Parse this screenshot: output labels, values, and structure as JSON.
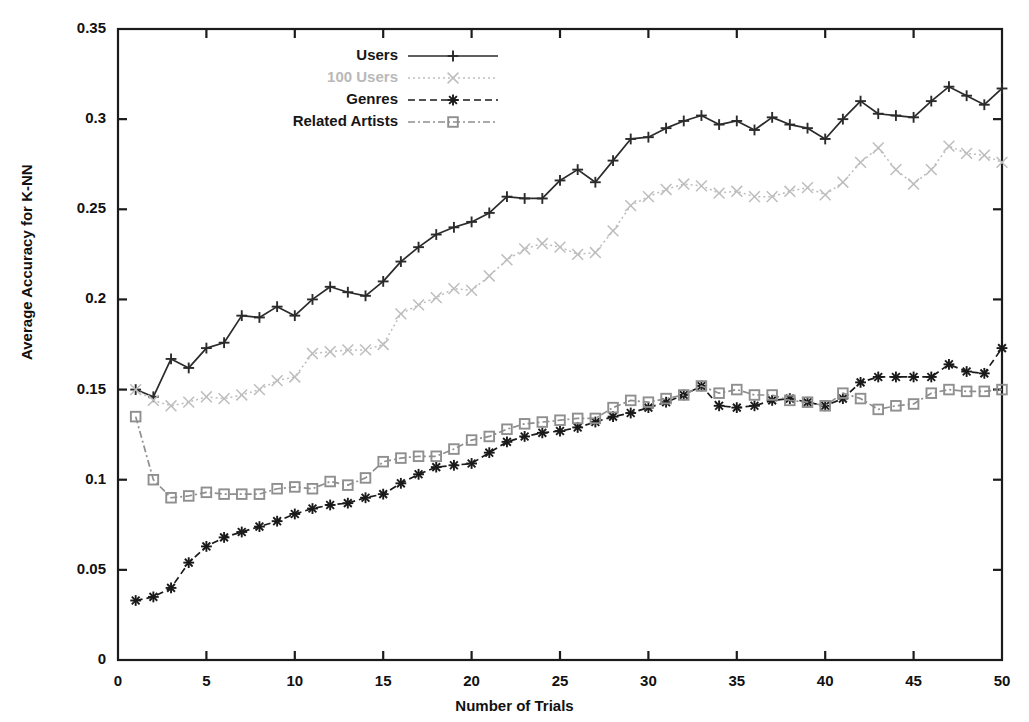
{
  "chart_data": {
    "type": "line",
    "title": "",
    "xlabel": "Number of Trials",
    "ylabel": "Average Accuracy for K-NN",
    "xlim": [
      0,
      50
    ],
    "ylim": [
      0,
      0.35
    ],
    "grid": false,
    "legend_position": "top-center",
    "xticks": [
      "0",
      "5",
      "10",
      "15",
      "20",
      "25",
      "30",
      "35",
      "40",
      "45",
      "50"
    ],
    "xtick_values": [
      0,
      5,
      10,
      15,
      20,
      25,
      30,
      35,
      40,
      45,
      50
    ],
    "yticks": [
      "0",
      "0.05",
      "0.1",
      "0.15",
      "0.2",
      "0.25",
      "0.3",
      "0.35"
    ],
    "ytick_values": [
      0,
      0.05,
      0.1,
      0.15,
      0.2,
      0.25,
      0.3,
      0.35
    ],
    "x": [
      1,
      2,
      3,
      4,
      5,
      6,
      7,
      8,
      9,
      10,
      11,
      12,
      13,
      14,
      15,
      16,
      17,
      18,
      19,
      20,
      21,
      22,
      23,
      24,
      25,
      26,
      27,
      28,
      29,
      30,
      31,
      32,
      33,
      34,
      35,
      36,
      37,
      38,
      39,
      40,
      41,
      42,
      43,
      44,
      45,
      46,
      47,
      48,
      49,
      50
    ],
    "series": [
      {
        "name": "Users",
        "marker": "plus",
        "line_style": "solid",
        "color": "#2b2b2b",
        "values": [
          0.15,
          0.146,
          0.167,
          0.162,
          0.173,
          0.176,
          0.191,
          0.19,
          0.196,
          0.191,
          0.2,
          0.207,
          0.204,
          0.202,
          0.21,
          0.221,
          0.229,
          0.236,
          0.24,
          0.243,
          0.248,
          0.257,
          0.256,
          0.256,
          0.266,
          0.272,
          0.265,
          0.277,
          0.289,
          0.29,
          0.295,
          0.299,
          0.302,
          0.297,
          0.299,
          0.294,
          0.301,
          0.297,
          0.295,
          0.289,
          0.3,
          0.31,
          0.303,
          0.302,
          0.301,
          0.31,
          0.318,
          0.313,
          0.308,
          0.317
        ]
      },
      {
        "name": "100 Users",
        "marker": "cross",
        "line_style": "dotted",
        "color": "#bdbdbd",
        "values": [
          0.15,
          0.144,
          0.141,
          0.143,
          0.146,
          0.145,
          0.147,
          0.15,
          0.155,
          0.157,
          0.17,
          0.171,
          0.172,
          0.172,
          0.175,
          0.192,
          0.197,
          0.201,
          0.206,
          0.205,
          0.213,
          0.222,
          0.228,
          0.231,
          0.229,
          0.225,
          0.226,
          0.238,
          0.252,
          0.257,
          0.261,
          0.264,
          0.263,
          0.259,
          0.26,
          0.257,
          0.257,
          0.26,
          0.262,
          0.258,
          0.265,
          0.276,
          0.284,
          0.272,
          0.264,
          0.272,
          0.285,
          0.281,
          0.28,
          0.276
        ]
      },
      {
        "name": "Genres",
        "marker": "star",
        "line_style": "dashed",
        "color": "#1a1a1a",
        "values": [
          0.033,
          0.035,
          0.04,
          0.054,
          0.063,
          0.068,
          0.071,
          0.074,
          0.077,
          0.081,
          0.084,
          0.086,
          0.087,
          0.09,
          0.092,
          0.098,
          0.103,
          0.107,
          0.108,
          0.109,
          0.115,
          0.121,
          0.124,
          0.126,
          0.127,
          0.129,
          0.132,
          0.135,
          0.137,
          0.14,
          0.143,
          0.147,
          0.152,
          0.141,
          0.14,
          0.141,
          0.144,
          0.145,
          0.143,
          0.141,
          0.145,
          0.154,
          0.157,
          0.157,
          0.157,
          0.157,
          0.164,
          0.16,
          0.159,
          0.173
        ]
      },
      {
        "name": "Related Artists",
        "marker": "square",
        "line_style": "dashdot",
        "color": "#8f8f8f",
        "values": [
          0.135,
          0.1,
          0.09,
          0.091,
          0.093,
          0.092,
          0.092,
          0.092,
          0.095,
          0.096,
          0.095,
          0.099,
          0.097,
          0.101,
          0.11,
          0.112,
          0.113,
          0.113,
          0.117,
          0.122,
          0.124,
          0.128,
          0.131,
          0.132,
          0.133,
          0.134,
          0.134,
          0.14,
          0.144,
          0.143,
          0.145,
          0.147,
          0.152,
          0.148,
          0.15,
          0.147,
          0.147,
          0.144,
          0.143,
          0.141,
          0.148,
          0.145,
          0.139,
          0.141,
          0.142,
          0.148,
          0.15,
          0.149,
          0.149,
          0.15
        ]
      }
    ]
  },
  "legend": {
    "items": [
      {
        "label": "Users"
      },
      {
        "label": "100 Users"
      },
      {
        "label": "Genres"
      },
      {
        "label": "Related Artists"
      }
    ]
  }
}
